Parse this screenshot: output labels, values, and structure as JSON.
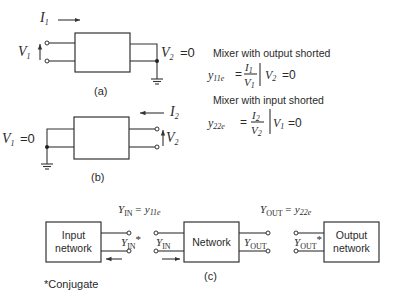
{
  "panel_a": {
    "current_label": "I",
    "current_sub": "1",
    "voltage_in_label": "V",
    "voltage_in_sub": "1",
    "voltage_out_label": "V",
    "voltage_out_sub": "2",
    "voltage_out_value": "=0",
    "caption": "(a)"
  },
  "panel_b": {
    "current_label": "I",
    "current_sub": "2",
    "voltage_in_label": "V",
    "voltage_in_sub": "1",
    "voltage_in_value": "=0",
    "voltage_out_label": "V",
    "voltage_out_sub": "2",
    "caption": "(b)"
  },
  "equations": {
    "eq1_heading": "Mixer with output shorted",
    "eq1_lhs": "y",
    "eq1_lhs_sub": "11e",
    "eq1_num": "I",
    "eq1_num_sub": "1",
    "eq1_den": "V",
    "eq1_den_sub": "1",
    "eq1_cond": "V",
    "eq1_cond_sub": "2",
    "eq1_cond_value": "=0",
    "eq2_heading": "Mixer with input shorted",
    "eq2_lhs": "y",
    "eq2_lhs_sub": "22e",
    "eq2_num": "I",
    "eq2_num_sub": "2",
    "eq2_den": "V",
    "eq2_den_sub": "2",
    "eq2_cond": "V",
    "eq2_cond_sub": "1",
    "eq2_cond_value": "=0"
  },
  "panel_c": {
    "yin_eq": "Y",
    "yin_eq_sub": "IN",
    "yin_eq_rhs": "= y",
    "yin_eq_rhs_sub": "11e",
    "yout_eq": "Y",
    "yout_eq_sub": "OUT",
    "yout_eq_rhs": "= y",
    "yout_eq_rhs_sub": "22e",
    "input_network_line1": "Input",
    "input_network_line2": "network",
    "network_label": "Network",
    "output_network_line1": "Output",
    "output_network_line2": "network",
    "yin_conj": "Y",
    "yin_conj_sub": "IN",
    "yin_conj_star": "*",
    "yin": "Y",
    "yin_sub": "IN",
    "yout": "Y",
    "yout_sub": "OUT",
    "yout_conj": "Y",
    "yout_conj_sub": "OUT",
    "yout_conj_star": "*",
    "caption": "(c)"
  },
  "footnote": "*Conjugate"
}
